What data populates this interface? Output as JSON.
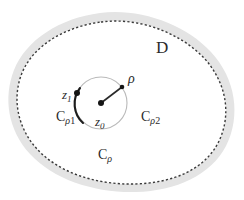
{
  "figure": {
    "background_color": "#ffffff",
    "width": 244,
    "height": 200
  },
  "colors": {
    "outer_band_fill": "#e4e4e4",
    "domain_fill": "#ffffff",
    "boundary_dash": "#3a3a3a",
    "circle_stroke": "#b9b9b9",
    "arc_thick_stroke": "#1d1d1d",
    "radius_line": "#2a2a2a",
    "point_marker": "#151515",
    "text": "#2b2b2b"
  },
  "labels": {
    "domain": "D",
    "radius": "ρ",
    "center_point": "z",
    "center_point_sub": "0",
    "boundary_point": "z",
    "boundary_point_sub": "1",
    "circle_full": "C",
    "circle_full_sub": "ρ",
    "arc_left": "C",
    "arc_left_sub_rho": "ρ",
    "arc_left_sub_num": "1",
    "arc_right": "C",
    "arc_right_sub_rho": "ρ",
    "arc_right_sub_num": "2"
  },
  "geometry": {
    "circle_center_x": 101,
    "circle_center_y": 103,
    "circle_radius": 26,
    "radius_endpoint_x": 122,
    "radius_endpoint_y": 87,
    "z1_x": 76,
    "z1_y": 93,
    "domain_dash_pattern": "2.2 2.2",
    "domain_dash_width": 1.4,
    "band_width": 9
  }
}
